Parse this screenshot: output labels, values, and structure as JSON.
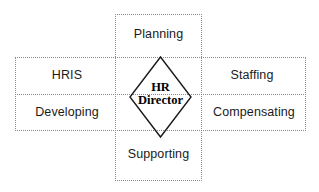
{
  "diagram": {
    "type": "cross-quadrant-diamond",
    "center": {
      "line_1": "HR",
      "line_2": "Director",
      "shape": "diamond",
      "outline_color": "#1a1a1a"
    },
    "vertical_axis": {
      "top_label": "Planning",
      "bottom_label": "Supporting",
      "border_style": "dotted",
      "border_color": "#8a8a8a"
    },
    "horizontal_axis": {
      "border_style": "dotted",
      "border_color": "#8a8a8a",
      "quadrants": {
        "top_left": "HRIS",
        "bottom_left": "Developing",
        "top_right": "Staffing",
        "bottom_right": "Compensating"
      }
    },
    "text_color": "#1a1a1a"
  }
}
